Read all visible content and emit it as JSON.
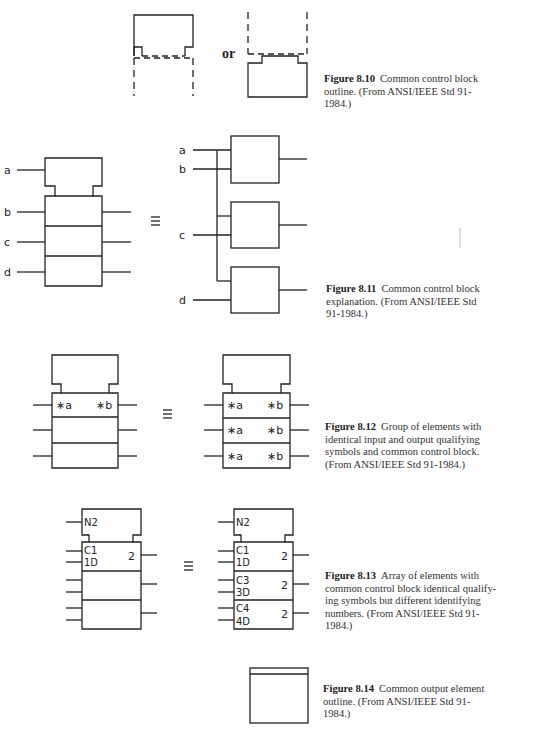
{
  "page": {
    "figures": [
      {
        "id": "8.10",
        "number_label": "Figure 8.10",
        "caption_lines": [
          "Common control block",
          "outline. (From ANSI/IEEE Std 91-",
          "1984.)"
        ],
        "connector_text": "or"
      },
      {
        "id": "8.11",
        "number_label": "Figure 8.11",
        "caption_lines": [
          "Common control block",
          "explanation. (From ANSI/IEEE Std",
          "91-1984.)"
        ],
        "left_labels": [
          "a",
          "b",
          "c",
          "d"
        ],
        "right_labels": [
          "a",
          "b",
          "c",
          "d"
        ],
        "equivalence": "≡"
      },
      {
        "id": "8.12",
        "number_label": "Figure 8.12",
        "caption_lines": [
          "Group of elements with",
          "identical input and output qualifying",
          "symbols and common control block.",
          "(From ANSI/IEEE Std 91-1984.)"
        ],
        "left_qualifiers": {
          "in": "∗a",
          "out": "∗b"
        },
        "right_qualifiers": [
          {
            "in": "∗a",
            "out": "∗b"
          },
          {
            "in": "∗a",
            "out": "∗b"
          },
          {
            "in": "∗a",
            "out": "∗b"
          }
        ],
        "equivalence": "≡"
      },
      {
        "id": "8.13",
        "number_label": "Figure 8.13",
        "caption_lines": [
          "Array of elements with",
          "common control block identical qualify-",
          "ing symbols but different identifying",
          "numbers. (From ANSI/IEEE Std 91-",
          "1984.)"
        ],
        "control_label": "N2",
        "left_element": {
          "line1": "C1",
          "line2": "1D",
          "out": "2"
        },
        "right_elements": [
          {
            "line1": "C1",
            "line2": "1D",
            "out": "2"
          },
          {
            "line1": "C3",
            "line2": "3D",
            "out": "2"
          },
          {
            "line1": "C4",
            "line2": "4D",
            "out": "2"
          }
        ],
        "equivalence": "≡"
      },
      {
        "id": "8.14",
        "number_label": "Figure 8.14",
        "caption_lines": [
          "Common output element",
          "outline. (From ANSI/IEEE Std 91-",
          "1984.)"
        ]
      }
    ]
  }
}
